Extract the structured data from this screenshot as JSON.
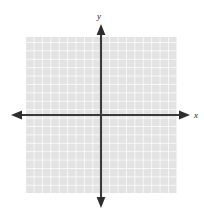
{
  "figure": {
    "title": "",
    "kind": "cartesian-coordinate-grid",
    "background_color": "#ffffff"
  },
  "axes": {
    "x_axis": {
      "label": "x",
      "label_x": 196,
      "label_y": 117,
      "color": "#3a3a3a",
      "y_position": 115,
      "start_x": 11,
      "end_x": 190,
      "arrow_start": true,
      "arrow_end": true
    },
    "y_axis": {
      "label": "y",
      "label_x": 99,
      "label_y": 19,
      "color": "#3a3a3a",
      "x_position": 101,
      "start_y": 24,
      "end_y": 208,
      "arrow_start": true,
      "arrow_end": true
    }
  },
  "grid": {
    "left": 26,
    "top": 37,
    "right": 177,
    "bottom": 193,
    "cell_size": 8.4,
    "columns": 18,
    "rows": 18.5,
    "cell_fill_color": "#e3e3e3",
    "line_color": "#ffffff",
    "line_width": 1.4,
    "visible": true
  },
  "chart_data": {
    "type": "line",
    "title": "",
    "xlabel": "x",
    "ylabel": "y",
    "series": [],
    "categories": [],
    "values": [],
    "x": [],
    "xlim": [
      -9,
      9
    ],
    "ylim": [
      -9.5,
      9.5
    ],
    "grid": true,
    "legend": "none",
    "annotations": [],
    "tick_labels": {
      "x": [],
      "y": []
    }
  }
}
